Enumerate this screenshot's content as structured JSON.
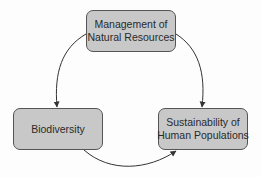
{
  "diagram": {
    "type": "cycle",
    "nodes": [
      {
        "id": "management",
        "lines": [
          "Management of",
          "Natural Resources"
        ]
      },
      {
        "id": "biodiversity",
        "lines": [
          "Biodiversity"
        ]
      },
      {
        "id": "sustainability",
        "lines": [
          "Sustainability of",
          "Human Populations"
        ]
      }
    ],
    "edges": [
      {
        "from": "management",
        "to": "biodiversity"
      },
      {
        "from": "management",
        "to": "sustainability"
      },
      {
        "from": "biodiversity",
        "to": "sustainability"
      }
    ],
    "colors": {
      "node_fill": "#c8c8c8",
      "node_border": "#555555",
      "text": "#2a2a2a",
      "arrow": "#333333",
      "background": "#fdfdfd"
    }
  }
}
